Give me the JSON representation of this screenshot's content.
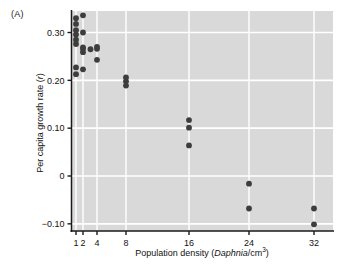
{
  "panel": {
    "label": "(A)"
  },
  "chart_data": {
    "type": "scatter",
    "title": "",
    "xlabel_parts": {
      "pre": "Population density (",
      "italic": "Daphnia",
      "post": "/cm",
      "sup": "3",
      "tail": ")"
    },
    "xlabel": "Population density (Daphnia/cm3)",
    "ylabel_parts": {
      "pre": "Per capita growth rate (",
      "italic": "r",
      "post": ")"
    },
    "ylabel": "Per capita growth rate (r)",
    "xticks": [
      1,
      2,
      4,
      8,
      16,
      24,
      32
    ],
    "xticklabels": [
      "1",
      "2",
      "4",
      "8",
      "16",
      "24",
      "32"
    ],
    "yticks": [
      0.3,
      0.2,
      0.1,
      0,
      -0.1
    ],
    "yticklabels": [
      "0.30",
      "0.20",
      "0.10",
      "0",
      "-0.10"
    ],
    "ylim": [
      -0.115,
      0.345
    ],
    "xlim": [
      0.75,
      34
    ],
    "grid": "white-major",
    "legend": "none",
    "marker_color": "#3d3d3d",
    "plot_bg": "#d9d9d9",
    "points": [
      {
        "x": 1,
        "y": 0.33
      },
      {
        "x": 1,
        "y": 0.318
      },
      {
        "x": 1,
        "y": 0.305
      },
      {
        "x": 1,
        "y": 0.296
      },
      {
        "x": 1,
        "y": 0.285
      },
      {
        "x": 1,
        "y": 0.276
      },
      {
        "x": 1,
        "y": 0.227
      },
      {
        "x": 1,
        "y": 0.213
      },
      {
        "x": 2,
        "y": 0.336
      },
      {
        "x": 2,
        "y": 0.3
      },
      {
        "x": 2,
        "y": 0.269
      },
      {
        "x": 2,
        "y": 0.266
      },
      {
        "x": 2,
        "y": 0.259
      },
      {
        "x": 2,
        "y": 0.223
      },
      {
        "x": 3,
        "y": 0.265
      },
      {
        "x": 4,
        "y": 0.27
      },
      {
        "x": 4,
        "y": 0.266
      },
      {
        "x": 4,
        "y": 0.243
      },
      {
        "x": 8,
        "y": 0.206
      },
      {
        "x": 8,
        "y": 0.198
      },
      {
        "x": 8,
        "y": 0.189
      },
      {
        "x": 16,
        "y": 0.117
      },
      {
        "x": 16,
        "y": 0.101
      },
      {
        "x": 16,
        "y": 0.064
      },
      {
        "x": 24,
        "y": -0.016
      },
      {
        "x": 24,
        "y": -0.068
      },
      {
        "x": 32,
        "y": -0.068
      },
      {
        "x": 32,
        "y": -0.101
      }
    ]
  }
}
